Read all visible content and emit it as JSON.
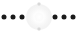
{
  "widget": {
    "name": "dot-row-indicator",
    "width": 77,
    "height": 33,
    "background_color": "#ffffff",
    "dot_color": "#1a1a1a",
    "glow_color": "#f2f2f2",
    "tick_color": "#d8d8d8",
    "center_x": 38.5,
    "center_y": 16.5
  },
  "dots": [
    {
      "label": "dot-1",
      "x": 4,
      "y": 16.5,
      "side": "left"
    },
    {
      "label": "dot-2",
      "x": 13,
      "y": 16.5,
      "side": "left"
    },
    {
      "label": "dot-3",
      "x": 22,
      "y": 16.5,
      "side": "left"
    },
    {
      "label": "dot-4",
      "x": 55,
      "y": 16.5,
      "side": "right"
    },
    {
      "label": "dot-5",
      "x": 64,
      "y": 16.5,
      "side": "right"
    },
    {
      "label": "dot-6",
      "x": 73,
      "y": 16.5,
      "side": "right"
    }
  ],
  "ticks": [
    {
      "label": "tick-top",
      "x": 38.5,
      "y": 4
    },
    {
      "label": "tick-bottom",
      "x": 38.5,
      "y": 29
    }
  ],
  "center": {
    "label": "center-glow",
    "kind": "starburst",
    "x": 38.5,
    "y": 16.5,
    "radius": 13
  }
}
